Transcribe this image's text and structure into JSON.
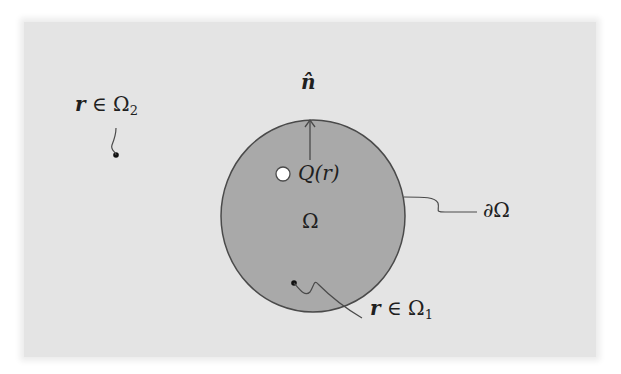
{
  "diagram": {
    "colors": {
      "background": "#ffffff",
      "panel": "#e4e4e4",
      "domain_fill": "#a9a9a9",
      "stroke": "#4a4a4a",
      "text": "#1f1f1f"
    },
    "labels": {
      "normal": "n̂",
      "source": "Q(r)",
      "domain": "Ω",
      "boundary": "∂Ω",
      "inside_point_var": "r",
      "inside_point_rel": " ∈ Ω",
      "inside_point_sub": "1",
      "outside_point_var": "r",
      "outside_point_rel": " ∈ Ω",
      "outside_point_sub": "2"
    }
  }
}
